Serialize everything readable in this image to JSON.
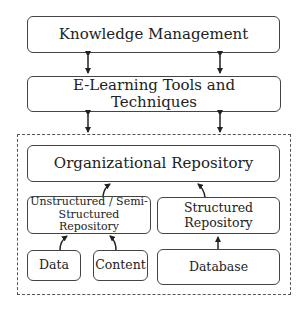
{
  "diagram": {
    "nodes": {
      "knowledge_management": "Knowledge Management",
      "elearning": "E-Learning Tools and Techniques",
      "org_repo": "Organizational Repository",
      "unstructured_line1": "Unstructured / Semi-",
      "unstructured_line2": "Structured Repository",
      "structured_line1": "Structured",
      "structured_line2": "Repository",
      "data": "Data",
      "content": "Content",
      "database": "Database"
    },
    "edges": [
      {
        "from": "knowledge_management",
        "to": "elearning",
        "type": "bidirectional"
      },
      {
        "from": "knowledge_management",
        "to": "elearning",
        "type": "bidirectional"
      },
      {
        "from": "elearning",
        "to": "org_repo_group",
        "type": "bidirectional"
      },
      {
        "from": "elearning",
        "to": "org_repo_group",
        "type": "bidirectional"
      },
      {
        "from": "unstructured",
        "to": "org_repo",
        "type": "directed"
      },
      {
        "from": "structured",
        "to": "org_repo",
        "type": "directed"
      },
      {
        "from": "data",
        "to": "unstructured",
        "type": "directed"
      },
      {
        "from": "content",
        "to": "unstructured",
        "type": "directed"
      },
      {
        "from": "database",
        "to": "structured",
        "type": "directed"
      }
    ]
  }
}
